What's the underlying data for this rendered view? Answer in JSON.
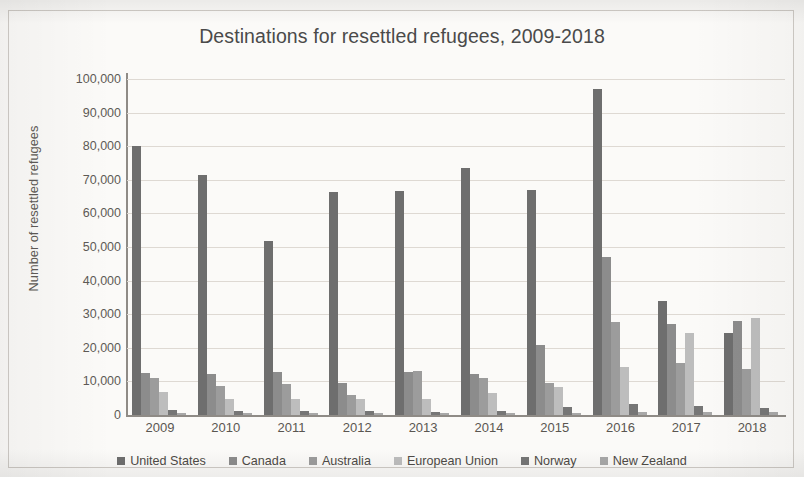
{
  "chart_data": {
    "type": "bar",
    "title": "Destinations for resettled refugees, 2009-2018",
    "xlabel": "",
    "ylabel": "Number of resettled refugees",
    "ylim": [
      0,
      100000
    ],
    "ytick_labels": [
      "100,000",
      "90,000",
      "80,000",
      "70,000",
      "60,000",
      "50,000",
      "40,000",
      "30,000",
      "20,000",
      "10,000",
      "0"
    ],
    "ytick_values": [
      100000,
      90000,
      80000,
      70000,
      60000,
      50000,
      40000,
      30000,
      20000,
      10000,
      0
    ],
    "grid": true,
    "legend_position": "bottom",
    "categories": [
      "2009",
      "2010",
      "2011",
      "2012",
      "2013",
      "2014",
      "2015",
      "2016",
      "2017",
      "2018"
    ],
    "series": [
      {
        "name": "United States",
        "color": "#6e6e6e",
        "values": [
          80000,
          71500,
          51800,
          66500,
          66700,
          73500,
          67000,
          97000,
          33800,
          24300
        ]
      },
      {
        "name": "Canada",
        "color": "#8c8c8c",
        "values": [
          12500,
          12100,
          12900,
          9600,
          12900,
          12200,
          20900,
          47000,
          27000,
          28000
        ]
      },
      {
        "name": "Australia",
        "color": "#9c9c9c",
        "values": [
          11100,
          8500,
          9200,
          5900,
          13200,
          11100,
          9400,
          27600,
          15600,
          13600
        ]
      },
      {
        "name": "European Union",
        "color": "#bdbdbd",
        "values": [
          6800,
          4900,
          4800,
          4900,
          4900,
          6500,
          8200,
          14200,
          24500,
          28800
        ]
      },
      {
        "name": "Norway",
        "color": "#767676",
        "values": [
          1400,
          1100,
          1300,
          1200,
          900,
          1200,
          2400,
          3200,
          2800,
          2200
        ]
      },
      {
        "name": "New Zealand",
        "color": "#a8a8a8",
        "values": [
          700,
          700,
          700,
          700,
          700,
          700,
          700,
          800,
          900,
          900
        ]
      }
    ]
  },
  "legend": {
    "items": [
      {
        "label": "United States"
      },
      {
        "label": "Canada"
      },
      {
        "label": "Australia"
      },
      {
        "label": "European Union"
      },
      {
        "label": "Norway"
      },
      {
        "label": "New Zealand"
      }
    ]
  }
}
